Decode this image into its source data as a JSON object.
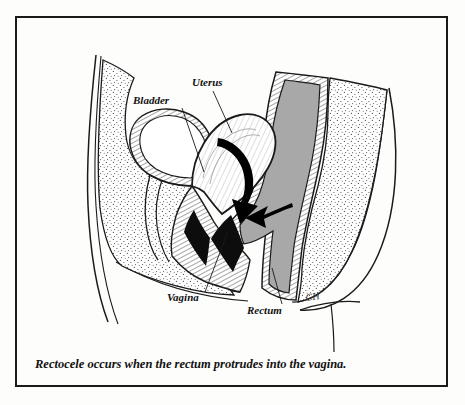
{
  "figure": {
    "kind": "medical-illustration",
    "view": "female pelvis midsagittal cross-section",
    "title_condition": "Rectocele",
    "caption": "Rectocele occurs when the rectum protrudes into the vagina.",
    "signature": "CH",
    "frame": {
      "border_color": "#1a1a1a",
      "background_color": "#fdfdfc"
    },
    "palette": {
      "ink": "#111111",
      "line": "#1a1a1a",
      "rectum_lumen_gray": "#a8a8a8",
      "tissue_stipple": "#555555",
      "organ_fill": "#ffffff",
      "arrow_black": "#000000",
      "paper": "#fdfdfc"
    },
    "labels": [
      {
        "id": "bladder",
        "text": "Bladder",
        "text_x": 133,
        "text_y": 104,
        "anchor": "start",
        "leader": "M 182 108 L 204 172"
      },
      {
        "id": "uterus",
        "text": "Uterus",
        "text_x": 192,
        "text_y": 86,
        "anchor": "start",
        "leader": "M 213 91 L 232 133"
      },
      {
        "id": "vagina",
        "text": "Vagina",
        "text_x": 167,
        "text_y": 301,
        "anchor": "start",
        "leader": "M 205 292 L 228 231"
      },
      {
        "id": "rectum",
        "text": "Rectum",
        "text_x": 247,
        "text_y": 314,
        "anchor": "start",
        "leader": "M 282 304 L 272 268"
      }
    ],
    "arrows": [
      {
        "id": "uterus-descent-arrow",
        "description": "curved black arrow showing downward descent through the pelvis"
      },
      {
        "id": "rectum-protrusion-arrow",
        "description": "straight black arrow pointing left showing rectum bulging into vagina"
      }
    ],
    "structures": [
      {
        "id": "body-contour",
        "name": "abdominal and thigh body outline"
      },
      {
        "id": "pelvic-tissue",
        "name": "stippled pelvic soft tissue"
      },
      {
        "id": "sacrum-tissue",
        "name": "stippled sacral tissue"
      },
      {
        "id": "bladder",
        "name": "urinary bladder"
      },
      {
        "id": "uterus",
        "name": "uterus"
      },
      {
        "id": "vagina",
        "name": "vaginal canal"
      },
      {
        "id": "rectum",
        "name": "rectum"
      }
    ]
  }
}
